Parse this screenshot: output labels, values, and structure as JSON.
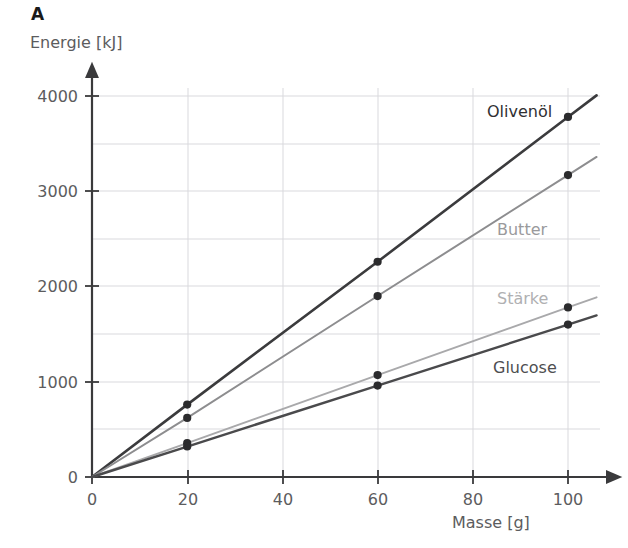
{
  "panel": {
    "letter": "A"
  },
  "axes": {
    "y_title": "Energie [kJ]",
    "x_title": "Masse [g]",
    "y_ticks": [
      "0",
      "1000",
      "2000",
      "3000",
      "4000"
    ],
    "x_ticks": [
      "0",
      "20",
      "40",
      "60",
      "80",
      "100"
    ]
  },
  "colors": {
    "olivenoel": "#3b3b3d",
    "butter": "#8d8d8f",
    "staerke": "#a9a9ab",
    "glucose": "#4a4a4c",
    "axis": "#3a3a3c",
    "grid": "#d9d9dd",
    "text": "#5c5c5e",
    "marker": "#2b2b2d"
  },
  "chart_data": {
    "type": "line",
    "title": "A",
    "xlabel": "Masse [g]",
    "ylabel": "Energie [kJ]",
    "xlim": [
      0,
      100
    ],
    "ylim": [
      0,
      4000
    ],
    "grid": true,
    "x_major_step": 20,
    "y_major_step": 1000,
    "y_minor_step": 500,
    "legend": "inline-line-labels",
    "x": [
      0,
      20,
      60,
      100
    ],
    "series": [
      {
        "name": "Olivenöl",
        "values": [
          0,
          760,
          2260,
          3780
        ],
        "markers_at": [
          20,
          60,
          100
        ],
        "energy_density_kJ_per_g": 37.8
      },
      {
        "name": "Butter",
        "values": [
          0,
          620,
          1900,
          3170
        ],
        "markers_at": [
          20,
          60,
          100
        ],
        "energy_density_kJ_per_g": 31.7
      },
      {
        "name": "Stärke",
        "values": [
          0,
          355,
          1070,
          1780
        ],
        "markers_at": [
          20,
          60,
          100
        ],
        "energy_density_kJ_per_g": 17.8
      },
      {
        "name": "Glucose",
        "values": [
          0,
          320,
          960,
          1600
        ],
        "markers_at": [
          20,
          60,
          100
        ],
        "energy_density_kJ_per_g": 16.0
      }
    ],
    "annotations": [
      {
        "text": "Olivenöl",
        "series": "Olivenöl"
      },
      {
        "text": "Butter",
        "series": "Butter"
      },
      {
        "text": "Stärke",
        "series": "Stärke"
      },
      {
        "text": "Glucose",
        "series": "Glucose"
      }
    ]
  }
}
